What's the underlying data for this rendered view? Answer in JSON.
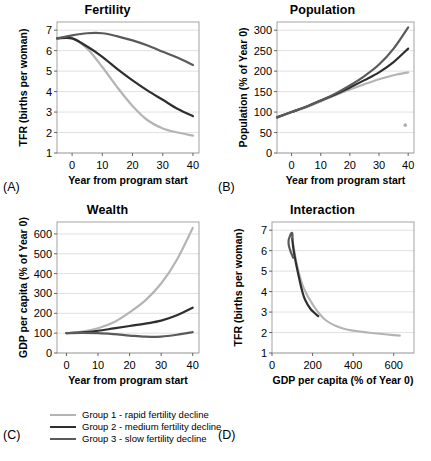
{
  "figure": {
    "panels": [
      {
        "letter": "(A)",
        "title": "Fertility",
        "xlabel": "Year from program start",
        "ylabel": "TFR (births per woman)"
      },
      {
        "letter": "(B)",
        "title": "Population",
        "xlabel": "Year from program start",
        "ylabel": "Population (% of Year 0)"
      },
      {
        "letter": "(C)",
        "title": "Wealth",
        "xlabel": "Year from program start",
        "ylabel": "GDP per capita (% of Year 0)"
      },
      {
        "letter": "(D)",
        "title": "Interaction",
        "xlabel": "GDP per capita (% of Year 0)",
        "ylabel": "TFR (births per woman)"
      }
    ],
    "legend": {
      "items": [
        {
          "label": "Group 1 - rapid fertility decline",
          "color": "#b4b4b4",
          "width": 2.2
        },
        {
          "label": "Group 2 - medium fertility decline",
          "color": "#2e2e2e",
          "width": 2.6
        },
        {
          "label": "Group 3 - slow fertility decline",
          "color": "#5a5a5a",
          "width": 2.6
        }
      ]
    },
    "colors": {
      "group1": "#b4b4b4",
      "group2": "#2e2e2e",
      "group3": "#5a5a5a",
      "gridline": "#d9d9d9",
      "axis": "#555555",
      "frame": "#9a9a9a",
      "stray_dot": "#b0b0b0"
    }
  },
  "chart_data": [
    {
      "id": "fertility",
      "type": "line",
      "title": "Fertility",
      "xlabel": "Year from program start",
      "ylabel": "TFR (births per woman)",
      "xlim": [
        -5,
        42
      ],
      "ylim": [
        1,
        7.4
      ],
      "xticks": [
        0,
        10,
        20,
        30,
        40
      ],
      "yticks": [
        1,
        2,
        3,
        4,
        5,
        6,
        7
      ],
      "grid": true,
      "legend_position": "external-bottom",
      "x": [
        -5,
        0,
        5,
        10,
        15,
        20,
        25,
        30,
        35,
        40
      ],
      "series": [
        {
          "name": "Group 1 - rapid fertility decline",
          "color": "#b4b4b4",
          "values": [
            6.6,
            6.6,
            6.1,
            5.2,
            4.2,
            3.3,
            2.6,
            2.2,
            2.0,
            1.85
          ]
        },
        {
          "name": "Group 2 - medium fertility decline",
          "color": "#2e2e2e",
          "values": [
            6.6,
            6.6,
            6.2,
            5.7,
            5.1,
            4.55,
            4.05,
            3.6,
            3.15,
            2.8
          ]
        },
        {
          "name": "Group 3 - slow fertility decline",
          "color": "#5a5a5a",
          "values": [
            6.6,
            6.75,
            6.85,
            6.85,
            6.7,
            6.5,
            6.25,
            5.95,
            5.65,
            5.3
          ]
        }
      ]
    },
    {
      "id": "population",
      "type": "line",
      "title": "Population",
      "xlabel": "Year from program start",
      "ylabel": "Population (% of Year 0)",
      "xlim": [
        -5,
        42
      ],
      "ylim": [
        0,
        320
      ],
      "xticks": [
        0,
        10,
        20,
        30,
        40
      ],
      "yticks": [
        0,
        50,
        100,
        150,
        200,
        250,
        300
      ],
      "grid": true,
      "legend_position": "external-bottom",
      "x": [
        -5,
        0,
        5,
        10,
        15,
        20,
        25,
        30,
        35,
        40
      ],
      "series": [
        {
          "name": "Group 1 - rapid fertility decline",
          "color": "#b4b4b4",
          "values": [
            87,
            100,
            112,
            126,
            141,
            155,
            168,
            180,
            190,
            197
          ]
        },
        {
          "name": "Group 2 - medium fertility decline",
          "color": "#2e2e2e",
          "values": [
            87,
            100,
            113,
            128,
            143,
            160,
            178,
            197,
            222,
            255
          ]
        },
        {
          "name": "Group 3 - slow fertility decline",
          "color": "#5a5a5a",
          "values": [
            87,
            100,
            113,
            128,
            145,
            165,
            188,
            216,
            255,
            307
          ]
        }
      ],
      "annotations": [
        {
          "name": "stray-dot",
          "x": 39,
          "y": 68,
          "color": "#b0b0b0"
        }
      ]
    },
    {
      "id": "wealth",
      "type": "line",
      "title": "Wealth",
      "xlabel": "Year from program start",
      "ylabel": "GDP per capita (% of Year 0)",
      "xlim": [
        -3,
        42
      ],
      "ylim": [
        0,
        660
      ],
      "xticks": [
        0,
        10,
        20,
        30,
        40
      ],
      "yticks": [
        0,
        100,
        200,
        300,
        400,
        500,
        600
      ],
      "grid": true,
      "legend_position": "external-bottom",
      "x": [
        0,
        5,
        10,
        15,
        20,
        25,
        30,
        35,
        40
      ],
      "series": [
        {
          "name": "Group 1 - rapid fertility decline",
          "color": "#b4b4b4",
          "values": [
            100,
            108,
            125,
            155,
            205,
            265,
            350,
            470,
            630
          ]
        },
        {
          "name": "Group 2 - medium fertility decline",
          "color": "#2e2e2e",
          "values": [
            100,
            104,
            112,
            124,
            136,
            148,
            163,
            190,
            228
          ]
        },
        {
          "name": "Group 3 - slow fertility decline",
          "color": "#5a5a5a",
          "values": [
            100,
            101,
            100,
            95,
            88,
            82,
            83,
            92,
            105
          ]
        }
      ]
    },
    {
      "id": "interaction",
      "type": "line",
      "title": "Interaction",
      "xlabel": "GDP per capita (% of Year 0)",
      "ylabel": "TFR (births per woman)",
      "xlim": [
        0,
        700
      ],
      "ylim": [
        1,
        7.4
      ],
      "xticks": [
        0,
        200,
        400,
        600
      ],
      "yticks": [
        1,
        2,
        3,
        4,
        5,
        6,
        7
      ],
      "grid": true,
      "legend_position": "external-bottom",
      "series": [
        {
          "name": "Group 1 - rapid fertility decline",
          "color": "#b4b4b4",
          "points": [
            [
              100,
              6.6
            ],
            [
              108,
              6.1
            ],
            [
              125,
              5.2
            ],
            [
              155,
              4.2
            ],
            [
              205,
              3.3
            ],
            [
              265,
              2.6
            ],
            [
              350,
              2.2
            ],
            [
              470,
              2.0
            ],
            [
              630,
              1.85
            ]
          ]
        },
        {
          "name": "Group 2 - medium fertility decline",
          "color": "#2e2e2e",
          "points": [
            [
              100,
              6.6
            ],
            [
              104,
              6.2
            ],
            [
              112,
              5.7
            ],
            [
              124,
              5.1
            ],
            [
              136,
              4.55
            ],
            [
              148,
              4.05
            ],
            [
              163,
              3.6
            ],
            [
              190,
              3.15
            ],
            [
              228,
              2.8
            ]
          ]
        },
        {
          "name": "Group 3 - slow fertility decline",
          "color": "#5a5a5a",
          "points": [
            [
              100,
              6.6
            ],
            [
              101,
              6.75
            ],
            [
              100,
              6.85
            ],
            [
              95,
              6.85
            ],
            [
              88,
              6.7
            ],
            [
              82,
              6.5
            ],
            [
              83,
              6.25
            ],
            [
              92,
              5.95
            ],
            [
              105,
              5.65
            ]
          ]
        }
      ]
    }
  ]
}
